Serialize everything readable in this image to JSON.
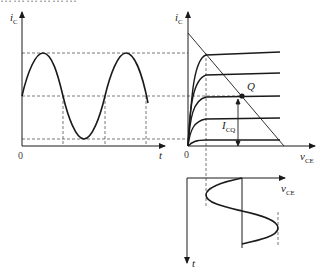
{
  "header": {
    "cut_text": "………………"
  },
  "left_plot": {
    "y_label": "i",
    "y_label_sub": "C",
    "x_label": "t",
    "origin": "0"
  },
  "right_plot": {
    "y_label": "i",
    "y_label_sub": "C",
    "x_label": "v",
    "x_label_sub": "CE",
    "origin": "0",
    "q_label": "Q",
    "icq_label": "I",
    "icq_label_sub": "CQ"
  },
  "bottom_plot": {
    "x_label": "v",
    "x_label_sub": "CE",
    "y_label": "t"
  },
  "colors": {
    "ink": "#1a1a1a",
    "dash": "#555555"
  }
}
